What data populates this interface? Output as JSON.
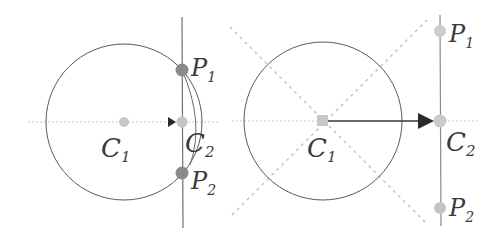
{
  "left": {
    "labels": {
      "c1": "C",
      "c1_sub": "1",
      "c2": "C",
      "c2_sub": "2",
      "p1": "P",
      "p1_sub": "1",
      "p2": "P",
      "p2_sub": "2"
    }
  },
  "right": {
    "labels": {
      "c1": "C",
      "c1_sub": "1",
      "c2": "C",
      "c2_sub": "2",
      "p1": "P",
      "p1_sub": "1",
      "p2": "P",
      "p2_sub": "2"
    }
  },
  "colors": {
    "circle": "#5a5a5a",
    "line": "#707070",
    "dotted": "#b8b8b8",
    "point_dark": "#8a8a8a",
    "point_light": "#c8c8c8",
    "arrow": "#2a2a2a"
  }
}
